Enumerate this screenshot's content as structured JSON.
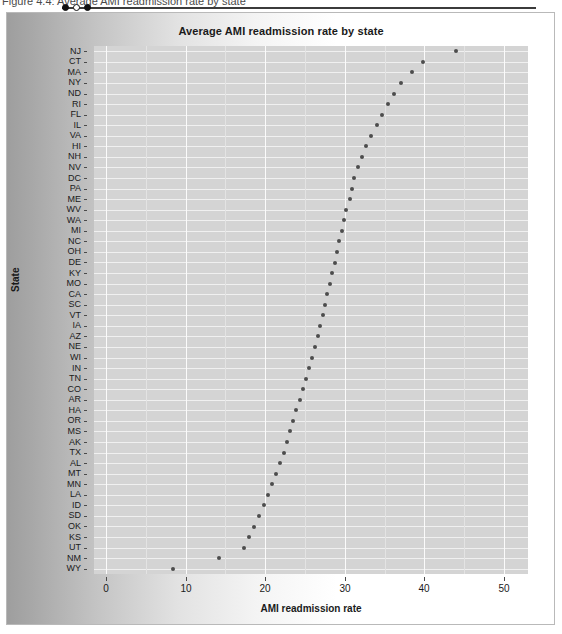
{
  "caption": {
    "text": "Figure 4.4: Average AMI readmission rate by state"
  },
  "slider": {
    "dots": [
      "filled",
      "hollow",
      "filled"
    ]
  },
  "chart_data": {
    "type": "scatter",
    "title": "Average AMI readmission rate by state",
    "xlabel": "AMI readmission rate",
    "ylabel": "State",
    "xlim": [
      -1.5,
      53
    ],
    "xticks": [
      0,
      10,
      20,
      30,
      40,
      50
    ],
    "grid": true,
    "legend": "none",
    "orientation": "horizontal-dotplot",
    "categories": [
      "NJ",
      "CT",
      "MA",
      "NY",
      "ND",
      "RI",
      "FL",
      "IL",
      "VA",
      "HI",
      "NH",
      "NV",
      "DC",
      "PA",
      "ME",
      "WV",
      "WA",
      "MI",
      "NC",
      "OH",
      "DE",
      "KY",
      "MO",
      "CA",
      "SC",
      "VT",
      "IA",
      "AZ",
      "NE",
      "WI",
      "IN",
      "TN",
      "CO",
      "AR",
      "HA",
      "OR",
      "MS",
      "AK",
      "TX",
      "AL",
      "MT",
      "MN",
      "LA",
      "ID",
      "SD",
      "OK",
      "KS",
      "UT",
      "NM",
      "WY"
    ],
    "values": [
      43.9,
      39.8,
      38.4,
      37.1,
      36.2,
      35.4,
      34.6,
      34.0,
      33.3,
      32.6,
      32.1,
      31.6,
      31.2,
      30.9,
      30.6,
      30.2,
      29.9,
      29.6,
      29.3,
      29.0,
      28.7,
      28.4,
      28.1,
      27.8,
      27.5,
      27.2,
      26.9,
      26.6,
      26.2,
      25.9,
      25.5,
      25.1,
      24.7,
      24.3,
      23.9,
      23.5,
      23.1,
      22.7,
      22.3,
      21.9,
      21.4,
      20.9,
      20.4,
      19.8,
      19.2,
      18.6,
      18.0,
      17.3,
      14.2,
      8.4
    ]
  }
}
